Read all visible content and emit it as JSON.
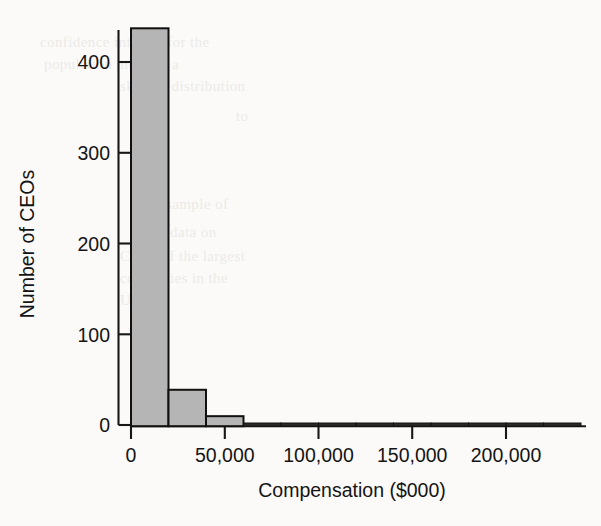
{
  "chart_data": {
    "type": "bar",
    "title": "",
    "subtitle": "",
    "xlabel": "Compensation ($000)",
    "ylabel": "Number of CEOs",
    "xlim": [
      0,
      240000
    ],
    "ylim": [
      0,
      460
    ],
    "grid": false,
    "legend": null,
    "bin_width": 20000,
    "x_tick_labels": [
      "0",
      "50,000",
      "100,000",
      "150,000",
      "200,000"
    ],
    "x_tick_values": [
      0,
      50000,
      100000,
      150000,
      200000
    ],
    "y_tick_labels": [
      "0",
      "100",
      "200",
      "300",
      "400"
    ],
    "y_tick_values": [
      0,
      100,
      200,
      300,
      400
    ],
    "bin_starts": [
      0,
      20000,
      40000,
      60000,
      80000,
      100000,
      120000,
      140000,
      160000,
      180000,
      200000,
      220000
    ],
    "values": [
      437,
      40,
      11,
      2,
      3,
      0,
      2,
      2,
      0,
      0,
      0,
      2
    ],
    "bar_fill": "#b5b5b5",
    "bar_stroke": "#101010",
    "background": "#fbfaf8"
  },
  "bleed_text": [
    {
      "t": "confidence interval for the",
      "x": 40,
      "y": 34
    },
    {
      "t": "population mean of a",
      "x": 44,
      "y": 56
    },
    {
      "t": "skewed distribution",
      "x": 120,
      "y": 78
    },
    {
      "t": "to",
      "x": 236,
      "y": 108
    },
    {
      "t": "sample of",
      "x": 166,
      "y": 196
    },
    {
      "t": "data on",
      "x": 170,
      "y": 224
    },
    {
      "t": "CEOs of the largest",
      "x": 120,
      "y": 248
    },
    {
      "t": "companies in the",
      "x": 120,
      "y": 270
    },
    {
      "t": "U.S. in",
      "x": 120,
      "y": 292
    }
  ]
}
